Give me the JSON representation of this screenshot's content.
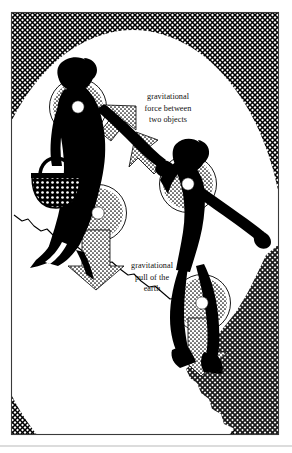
{
  "illustration": {
    "title": "Gravitational forces between two people and the earth",
    "type": "silhouette-diagram",
    "background_color": "#ffffff",
    "ink_color": "#000000",
    "frame_color": "#3a3a3a",
    "baseline_rule_color": "#b9b9b9",
    "frame": {
      "x": 11,
      "y": 12,
      "width": 268,
      "height": 423
    }
  },
  "labels": [
    {
      "name": "force-between-objects-label",
      "lines": [
        "gravitational",
        "force between",
        "two objects"
      ],
      "x": 168,
      "y": 99,
      "line_height": 11.5,
      "align": "center"
    },
    {
      "name": "pull-of-earth-label",
      "lines": [
        "gravitational",
        "pull of the",
        "earth"
      ],
      "x": 152,
      "y": 268,
      "line_height": 11.5,
      "align": "center"
    }
  ],
  "figures": [
    {
      "name": "adult-figure",
      "description": "silhouette of an adult carrying a basket, walking uphill, right arm extended holding child's hand",
      "fill": "#000000"
    },
    {
      "name": "child-figure",
      "description": "silhouette of a child reaching up to hold the adult's hand, left arm outstretched",
      "fill": "#000000"
    }
  ],
  "markers": [
    {
      "name": "adult-shoulder-center-of-mass-dot",
      "cx": 78,
      "cy": 107,
      "r": 6.2
    },
    {
      "name": "adult-hip-center-of-mass-dot",
      "cx": 98,
      "cy": 213,
      "r": 6.2
    },
    {
      "name": "child-chest-center-of-mass-dot",
      "cx": 188,
      "cy": 184,
      "r": 6.2
    },
    {
      "name": "child-knee-center-of-mass-dot",
      "cx": 202,
      "cy": 303,
      "r": 6.2
    }
  ],
  "halos": [
    {
      "name": "adult-shoulder-halo",
      "cx": 78,
      "cy": 107,
      "r": 28
    },
    {
      "name": "adult-hip-halo",
      "cx": 98,
      "cy": 213,
      "r": 28
    },
    {
      "name": "child-chest-halo",
      "cx": 188,
      "cy": 184,
      "r": 28
    },
    {
      "name": "child-knee-halo",
      "cx": 202,
      "cy": 303,
      "r": 28
    }
  ],
  "arrows": [
    {
      "name": "force-arrow-toward-adult",
      "direction": "down-left",
      "meaning": "gravitational force between two objects"
    },
    {
      "name": "force-arrow-toward-child",
      "direction": "down-right",
      "meaning": "gravitational force between two objects"
    },
    {
      "name": "earth-pull-arrow-adult",
      "direction": "down",
      "meaning": "gravitational pull of the earth"
    },
    {
      "name": "earth-pull-arrow-child",
      "direction": "down",
      "meaning": "gravitational pull of the earth"
    }
  ],
  "textures": [
    {
      "name": "sky-crosshatch-region",
      "style": "cross-hatch",
      "description": "cross-hatched band filling the corners outside the large white circle"
    },
    {
      "name": "ground-crosshatch-region",
      "style": "cross-hatch",
      "description": "cross-hatched earth mass in the lower right with a jagged upper edge"
    },
    {
      "name": "terrain-edge-line",
      "style": "jagged-line",
      "description": "irregular line marking the hillside the figures walk on"
    },
    {
      "name": "basket-weave-pattern",
      "style": "dotted-grid",
      "description": "white dotted weave on the adult's basket"
    }
  ]
}
